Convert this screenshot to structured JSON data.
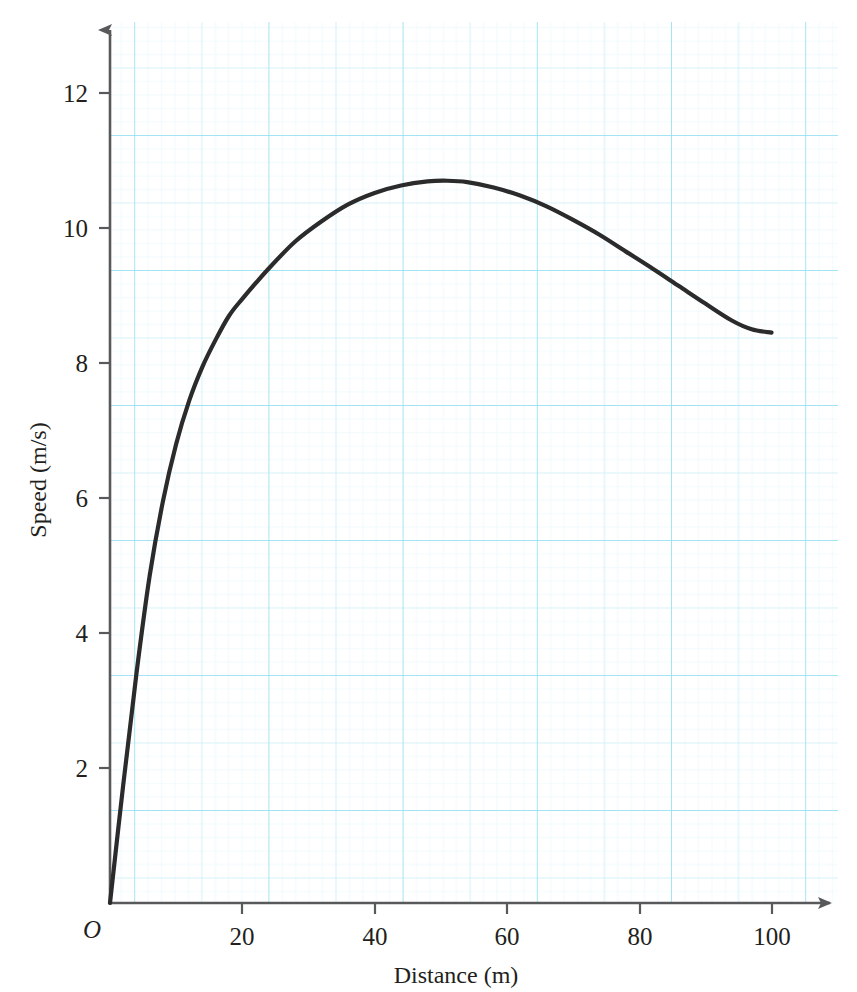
{
  "page": {
    "cropped_header_text": "",
    "background_color": "#ffffff",
    "grid_color_minor": "#d8f2f8",
    "grid_color_major": "#a8e4f0",
    "axis_color": "#58595b",
    "curve_color": "#2b2b2b"
  },
  "chart_data": {
    "type": "line",
    "title": "",
    "xlabel": "Distance (m)",
    "ylabel": "Speed (m/s)",
    "origin_label": "O",
    "grid": true,
    "grid_style": "graph-paper",
    "legend": "none",
    "xlim": [
      0,
      110
    ],
    "ylim": [
      0,
      13.1
    ],
    "xticks": [
      20,
      40,
      60,
      80,
      100
    ],
    "xtick_labels": [
      "20",
      "40",
      "60",
      "80",
      "100"
    ],
    "yticks": [
      2,
      4,
      6,
      8,
      10,
      12
    ],
    "ytick_labels": [
      "2",
      "4",
      "6",
      "8",
      "10",
      "12"
    ],
    "x_major_grid_step": 20,
    "y_major_grid_step": 2,
    "x_minor_grid_step": 2,
    "y_minor_grid_step": 0.2,
    "series": [
      {
        "name": "Speed",
        "x": [
          0,
          2,
          4,
          6,
          8,
          10,
          12,
          14,
          16,
          18,
          20,
          24,
          28,
          32,
          36,
          40,
          44,
          48,
          51,
          54,
          58,
          62,
          66,
          70,
          74,
          78,
          82,
          86,
          90,
          94,
          97,
          100
        ],
        "y": [
          0,
          1.75,
          3.4,
          4.85,
          5.95,
          6.8,
          7.45,
          7.95,
          8.35,
          8.7,
          8.95,
          9.4,
          9.8,
          10.1,
          10.35,
          10.52,
          10.63,
          10.69,
          10.7,
          10.68,
          10.6,
          10.48,
          10.32,
          10.12,
          9.9,
          9.65,
          9.4,
          9.14,
          8.88,
          8.63,
          8.5,
          8.45
        ]
      }
    ],
    "peak": {
      "x": 51,
      "y": 10.7
    },
    "endpoint": {
      "x": 100,
      "y": 8.45
    },
    "start_point": {
      "x": 0,
      "y": 0
    }
  }
}
